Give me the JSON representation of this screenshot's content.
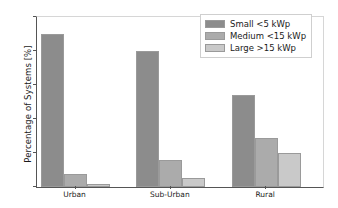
{
  "chart_data": {
    "type": "bar",
    "title": "",
    "xlabel": "",
    "ylabel": "Percentage of Systems [%]",
    "categories": [
      "Urban",
      "Sub-Urban",
      "Rural"
    ],
    "series": [
      {
        "name": "Small <5 kWp",
        "values": [
          90,
          80,
          54
        ],
        "color": "#8c8c8c"
      },
      {
        "name": "Medium <15 kWp",
        "values": [
          7.5,
          16,
          29
        ],
        "color": "#ababab"
      },
      {
        "name": "Large >15 kWp",
        "values": [
          2,
          5.5,
          20
        ],
        "color": "#c9c9c9"
      }
    ],
    "ylim": [
      0,
      100
    ],
    "yticks": [
      0,
      20,
      40,
      60,
      80,
      100
    ],
    "ytick_labels": [
      "0",
      "20",
      "40",
      "60",
      "80",
      "100"
    ],
    "grid": false,
    "legend_position": "upper right"
  },
  "legend": {
    "entries": [
      {
        "label": "Small <5 kWp"
      },
      {
        "label": "Medium <15 kWp"
      },
      {
        "label": "Large >15 kWp"
      }
    ]
  }
}
